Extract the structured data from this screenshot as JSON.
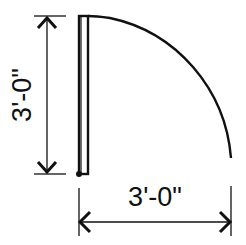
{
  "diagram": {
    "type": "door-swing-plan",
    "labels": {
      "vertical_dimension": "3'-0\"",
      "horizontal_dimension": "3'-0\""
    },
    "colors": {
      "line": "#111111",
      "background": "#ffffff"
    }
  }
}
